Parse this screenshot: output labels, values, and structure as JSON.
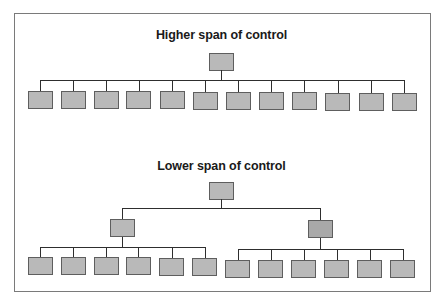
{
  "diagram": {
    "type": "org-chart-comparison",
    "colors": {
      "node_fill": "#b9b9b9",
      "node_fill_dark": "#a9a9a9",
      "node_border": "#5e5e5e",
      "connector": "#2e2e2e",
      "frame_border": "#7a7a7a",
      "background": "#ffffff"
    },
    "higher": {
      "title": "Higher span of control",
      "levels": 2,
      "root_count": 1,
      "children_count": 12
    },
    "lower": {
      "title": "Lower span of control",
      "levels": 3,
      "root_count": 1,
      "middle_count": 2,
      "children_per_middle": [
        6,
        6
      ]
    }
  }
}
